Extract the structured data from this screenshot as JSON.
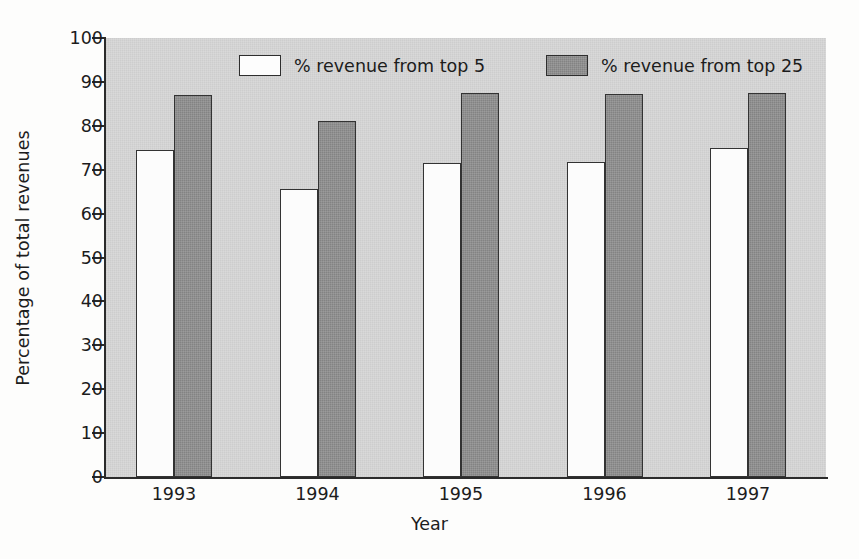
{
  "chart_data": {
    "type": "bar",
    "title": "",
    "xlabel": "Year",
    "ylabel": "Percentage of total revenues",
    "categories": [
      "1993",
      "1994",
      "1995",
      "1996",
      "1997"
    ],
    "series": [
      {
        "name": "% revenue from top 5",
        "color": "#fcfcfc",
        "values": [
          74.5,
          65.5,
          71.5,
          71.8,
          75.0
        ]
      },
      {
        "name": "% revenue from top 25",
        "color": "#838383",
        "values": [
          87.0,
          81.0,
          87.5,
          87.3,
          87.5
        ]
      }
    ],
    "ylim": [
      0,
      100
    ],
    "yticks": [
      0,
      10,
      20,
      30,
      40,
      50,
      60,
      70,
      80,
      90,
      100
    ],
    "ytick_labels": [
      "0",
      "10",
      "20",
      "30",
      "40",
      "50",
      "60",
      "70",
      "80",
      "90",
      "100"
    ],
    "grid": false,
    "legend_position": "top-inside",
    "plot_background": "#c9c9c9",
    "axis_color": "#2b2b2b"
  }
}
